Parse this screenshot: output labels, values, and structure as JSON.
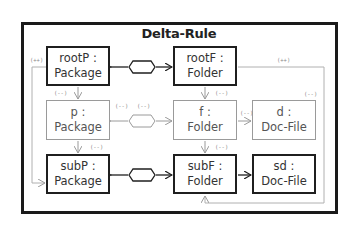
{
  "diagram": {
    "title": "Delta-Rule",
    "nodes": [
      {
        "id": "rootP",
        "label_line1": "rootP :",
        "label_line2": "Package",
        "style": "solid"
      },
      {
        "id": "rootF",
        "label_line1": "rootF :",
        "label_line2": "Folder",
        "style": "solid"
      },
      {
        "id": "p",
        "label_line1": "p :",
        "label_line2": "Package",
        "style": "ghost"
      },
      {
        "id": "f",
        "label_line1": "f :",
        "label_line2": "Folder",
        "style": "ghost"
      },
      {
        "id": "d",
        "label_line1": "d :",
        "label_line2": "Doc-File",
        "style": "ghost"
      },
      {
        "id": "subP",
        "label_line1": "subP :",
        "label_line2": "Package",
        "style": "solid"
      },
      {
        "id": "subF",
        "label_line1": "subF :",
        "label_line2": "Folder",
        "style": "solid"
      },
      {
        "id": "sd",
        "label_line1": "sd :",
        "label_line2": "Doc-File",
        "style": "solid"
      }
    ],
    "annotations": {
      "rootP_left": "(++)",
      "rootF_right": "(++)",
      "rootP_to_p": "(--)",
      "p_right": "(--)",
      "p_hex": "(--)",
      "rootF_to_f": "(--)",
      "f_to_d": "(--)",
      "d_top": "(--)",
      "p_to_subP": "(--)",
      "f_to_subF": "(--)"
    },
    "colors": {
      "solid": "#1f1f1f",
      "ghost": "#9a9a9a",
      "frame": "#1a1a1a"
    }
  }
}
